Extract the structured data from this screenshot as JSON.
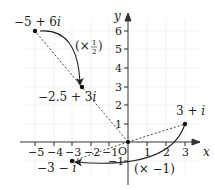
{
  "diagram": {
    "type": "argand-diagram",
    "axes": {
      "x_label": "x",
      "y_label": "y",
      "origin_label": "O",
      "x_ticks": [
        "−5",
        "−4",
        "−3",
        "−2",
        "−1",
        "1",
        "2",
        "3"
      ],
      "y_ticks": [
        "−1",
        "1",
        "2",
        "3",
        "4",
        "5",
        "6"
      ]
    },
    "points": [
      {
        "label": "−5 + 6i",
        "re": -5,
        "im": 6
      },
      {
        "label": "−2.5 + 3i",
        "re": -2.5,
        "im": 3
      },
      {
        "label": "3 + i",
        "re": 3,
        "im": 1
      },
      {
        "label": "−3 − i",
        "re": -3,
        "im": -1
      }
    ],
    "transformations": [
      {
        "label": "(× ½)",
        "from": "−5 + 6i",
        "to": "−2.5 + 3i"
      },
      {
        "label": "(× −1)",
        "from": "3 + i",
        "to": "−3 − i"
      }
    ],
    "labels": {
      "p1_main": "−5 + 6",
      "p1_i": "i",
      "p2_main": "−2.5 + 3",
      "p2_i": "i",
      "p3_main": "3 + ",
      "p3_i": "i",
      "p4_main": "−3 − ",
      "p4_i": "i",
      "half_open": "(×",
      "half_num": "1",
      "half_den": "2",
      "half_close": ")",
      "neg_label": "(× −1)"
    }
  }
}
